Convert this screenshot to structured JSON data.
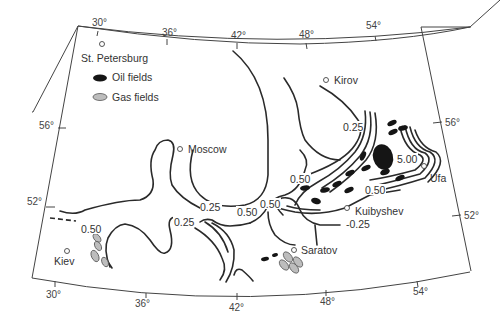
{
  "map": {
    "title": "",
    "legend": {
      "oil_label": "Oil fields",
      "gas_label": "Gas fields",
      "oil_color": "#151515",
      "gas_color": "#bdbdbd"
    },
    "longitude_labels_top": [
      "30°",
      "36°",
      "42°",
      "48°",
      "54°"
    ],
    "longitude_labels_bottom": [
      "30°",
      "36°",
      "42°",
      "48°",
      "54°"
    ],
    "latitude_labels_left": [
      "56°",
      "52°"
    ],
    "latitude_labels_right": [
      "56°",
      "52°"
    ],
    "cities": [
      {
        "name": "St. Petersburg"
      },
      {
        "name": "Moscow"
      },
      {
        "name": "Kirov"
      },
      {
        "name": "Ufa"
      },
      {
        "name": "Kuibyshev"
      },
      {
        "name": "Saratov"
      },
      {
        "name": "Kiev"
      }
    ],
    "contour_labels": [
      {
        "value": "0.25",
        "location": "northeast near Kirov"
      },
      {
        "value": "5.00",
        "location": "near Ufa"
      },
      {
        "value": "0.50",
        "location": "west of oil belt"
      },
      {
        "value": "0.50",
        "location": "north of Kuibyshev"
      },
      {
        "value": "-0.25",
        "location": "south of Kuibyshev"
      },
      {
        "value": "0.50",
        "location": "central"
      },
      {
        "value": "0.50",
        "location": "central-west"
      },
      {
        "value": "0.25",
        "location": "south of Moscow"
      },
      {
        "value": "0.25",
        "location": "southwest"
      },
      {
        "value": "0.50",
        "location": "near Kiev"
      }
    ]
  }
}
